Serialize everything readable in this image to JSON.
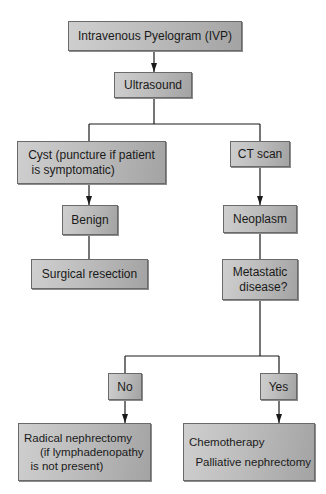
{
  "diagram": {
    "type": "flowchart",
    "nodes": {
      "ivp": "Intravenous Pyelogram (IVP)",
      "ultrasound": "Ultrasound",
      "cyst": "Cyst (puncture if patient\n is symptomatic)",
      "ct_scan": "CT scan",
      "benign": "Benign",
      "neoplasm": "Neoplasm",
      "surgical_resection": "Surgical resection",
      "metastatic": "Metastatic\n  disease?",
      "no": "No",
      "yes": "Yes",
      "radical": "Radical nephrectomy\n     (if lymphadenopathy\n  is not present)",
      "chemo": "Chemotherapy\n\n  Palliative nephrectomy"
    },
    "edges": [
      {
        "from": "ivp",
        "to": "ultrasound",
        "arrow": true
      },
      {
        "from": "ultrasound",
        "to": "cyst",
        "arrow": false
      },
      {
        "from": "ultrasound",
        "to": "ct_scan",
        "arrow": false
      },
      {
        "from": "cyst",
        "to": "benign",
        "arrow": true
      },
      {
        "from": "benign",
        "to": "surgical_resection",
        "arrow": false
      },
      {
        "from": "ct_scan",
        "to": "neoplasm",
        "arrow": true
      },
      {
        "from": "neoplasm",
        "to": "metastatic",
        "arrow": false
      },
      {
        "from": "metastatic",
        "to": "no",
        "arrow": false
      },
      {
        "from": "metastatic",
        "to": "yes",
        "arrow": false
      },
      {
        "from": "no",
        "to": "radical",
        "arrow": true
      },
      {
        "from": "yes",
        "to": "chemo",
        "arrow": true
      }
    ],
    "colors": {
      "box_fill_light": "#cfcfcf",
      "box_fill_dark": "#a3a3a3",
      "box_border": "#6a6a6a",
      "line": "#1a1a1a",
      "background": "#ffffff"
    }
  }
}
